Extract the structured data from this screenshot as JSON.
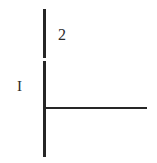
{
  "figure": {
    "width": 157,
    "height": 163,
    "background_color": "#ffffff",
    "stroke_color": "#262626",
    "label_color": "#2b2b2b",
    "labels": {
      "upper_right": "2",
      "mid_left": "I"
    },
    "strokes": [
      {
        "name": "vertical-line-upper-segment",
        "orientation": "vertical",
        "x": 44,
        "y1": 9,
        "y2": 58,
        "thickness": 2
      },
      {
        "name": "vertical-line-lower-segment",
        "orientation": "vertical",
        "x": 44,
        "y1": 61,
        "y2": 157,
        "thickness": 2
      },
      {
        "name": "horizontal-line",
        "orientation": "horizontal",
        "y": 108,
        "x1": 44,
        "x2": 147,
        "thickness": 2
      }
    ],
    "gap": {
      "name": "vertical-line-gap",
      "x": 44,
      "y1": 58,
      "y2": 61
    },
    "junction": {
      "name": "perpendicular-junction",
      "x": 44,
      "y": 108
    }
  }
}
